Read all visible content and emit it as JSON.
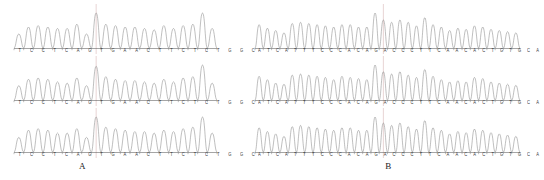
{
  "figure": {
    "type": "sanger-sequencing-chromatogram-figure",
    "background_color": "#ffffff",
    "trace_color": "#8a8a8a",
    "baseline_color": "#4a4a4a",
    "marker_color": "#d9b8b8",
    "text_color": "#3a3a3a"
  },
  "panels": [
    {
      "id": "A",
      "label": "A",
      "sequence": "TCCTCAGTGAACTTCTCTGGC",
      "bases": [
        "T",
        "C",
        "C",
        "T",
        "C",
        "A",
        "G",
        "T",
        "G",
        "A",
        "A",
        "C",
        "T",
        "T",
        "C",
        "T",
        "C",
        "T",
        "G",
        "G",
        "C"
      ],
      "base_count": 21,
      "marker_position_index": 8,
      "traces": [
        {
          "row": 1,
          "peak_heights": [
            10,
            15,
            16,
            15,
            14,
            14,
            17,
            10,
            25,
            17,
            16,
            15,
            15,
            14,
            13,
            16,
            14,
            16,
            17,
            25,
            14
          ]
        },
        {
          "row": 2,
          "peak_heights": [
            11,
            16,
            17,
            16,
            14,
            13,
            17,
            11,
            26,
            18,
            16,
            15,
            15,
            14,
            13,
            16,
            14,
            17,
            18,
            27,
            13
          ]
        },
        {
          "row": 3,
          "peak_heights": [
            10,
            15,
            16,
            15,
            13,
            13,
            16,
            10,
            24,
            17,
            16,
            15,
            14,
            14,
            13,
            15,
            14,
            16,
            17,
            24,
            13
          ]
        }
      ]
    },
    {
      "id": "B",
      "label": "B",
      "sequence": "ATCATTTCCCACAGACCCTTCAACACTGTGCA",
      "bases": [
        "A",
        "T",
        "C",
        "A",
        "T",
        "T",
        "T",
        "C",
        "C",
        "C",
        "A",
        "C",
        "A",
        "G",
        "A",
        "C",
        "C",
        "C",
        "T",
        "T",
        "C",
        "A",
        "A",
        "C",
        "A",
        "C",
        "T",
        "G",
        "T",
        "G",
        "C",
        "A"
      ],
      "base_count": 32,
      "marker_position_index": 15,
      "traces": [
        {
          "row": 1,
          "peak_heights": [
            20,
            17,
            15,
            13,
            21,
            22,
            21,
            20,
            19,
            18,
            20,
            20,
            18,
            18,
            30,
            24,
            22,
            24,
            22,
            19,
            26,
            20,
            18,
            15,
            17,
            16,
            19,
            18,
            16,
            15,
            14,
            13
          ]
        },
        {
          "row": 2,
          "peak_heights": [
            21,
            18,
            15,
            14,
            22,
            23,
            22,
            21,
            20,
            18,
            21,
            20,
            19,
            18,
            31,
            25,
            23,
            25,
            22,
            20,
            27,
            21,
            18,
            16,
            17,
            16,
            20,
            19,
            16,
            15,
            14,
            13
          ]
        },
        {
          "row": 3,
          "peak_heights": [
            20,
            17,
            15,
            13,
            21,
            22,
            21,
            20,
            19,
            18,
            20,
            20,
            18,
            18,
            29,
            24,
            22,
            24,
            21,
            19,
            26,
            20,
            18,
            15,
            17,
            16,
            19,
            18,
            16,
            15,
            14,
            13
          ]
        }
      ]
    }
  ],
  "layout": {
    "rows": [
      {
        "index": 0,
        "baseline_y": 48,
        "trace_top_y": 12,
        "letters_y": 49
      },
      {
        "index": 1,
        "baseline_y": 100,
        "trace_top_y": 64,
        "letters_y": 101
      },
      {
        "index": 2,
        "baseline_y": 152,
        "trace_top_y": 116,
        "letters_y": 153
      }
    ],
    "label_y": 161
  }
}
